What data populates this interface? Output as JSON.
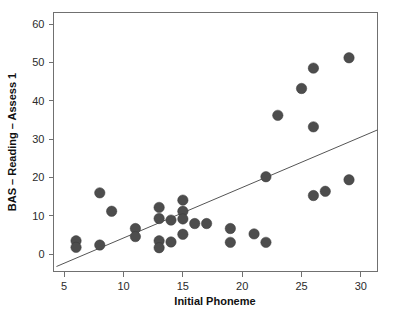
{
  "chart_data": {
    "type": "scatter",
    "title": "",
    "xlabel": "Initial Phoneme",
    "ylabel": "BAS – Reading – Assess 1",
    "xlim": [
      4.1,
      31.4
    ],
    "ylim": [
      -4.5,
      63.0
    ],
    "xticks": [
      5,
      10,
      15,
      20,
      25,
      30
    ],
    "yticks": [
      0,
      10,
      20,
      30,
      40,
      50,
      60
    ],
    "xtick_labels": [
      "5",
      "10",
      "15",
      "20",
      "25",
      "30"
    ],
    "ytick_labels": [
      "0",
      "10",
      "20",
      "30",
      "40",
      "50",
      "60"
    ],
    "grid": false,
    "legend": null,
    "marker": {
      "shape": "circle",
      "color": "#4d4d4d",
      "edge_color": "#3a3a3a",
      "size": 5.2
    },
    "series": [
      {
        "name": "Participants",
        "points": [
          {
            "x": 6,
            "y": 3.5
          },
          {
            "x": 6,
            "y": 1.8
          },
          {
            "x": 8,
            "y": 16.0
          },
          {
            "x": 8,
            "y": 2.4
          },
          {
            "x": 9,
            "y": 11.2
          },
          {
            "x": 11,
            "y": 6.7
          },
          {
            "x": 11,
            "y": 4.6
          },
          {
            "x": 13,
            "y": 12.2
          },
          {
            "x": 13,
            "y": 9.3
          },
          {
            "x": 13,
            "y": 3.5
          },
          {
            "x": 13,
            "y": 1.7
          },
          {
            "x": 14,
            "y": 8.9
          },
          {
            "x": 14,
            "y": 3.2
          },
          {
            "x": 15,
            "y": 14.1
          },
          {
            "x": 15,
            "y": 11.2
          },
          {
            "x": 15,
            "y": 9.2
          },
          {
            "x": 15,
            "y": 5.2
          },
          {
            "x": 16,
            "y": 8.0
          },
          {
            "x": 17,
            "y": 8.0
          },
          {
            "x": 19,
            "y": 6.7
          },
          {
            "x": 19,
            "y": 3.1
          },
          {
            "x": 21,
            "y": 5.3
          },
          {
            "x": 22,
            "y": 20.2
          },
          {
            "x": 22,
            "y": 3.1
          },
          {
            "x": 23,
            "y": 36.2
          },
          {
            "x": 25,
            "y": 43.2
          },
          {
            "x": 26,
            "y": 48.5
          },
          {
            "x": 26,
            "y": 33.2
          },
          {
            "x": 26,
            "y": 15.3
          },
          {
            "x": 27,
            "y": 16.4
          },
          {
            "x": 29,
            "y": 51.2
          },
          {
            "x": 29,
            "y": 19.4
          }
        ]
      }
    ],
    "fit_line": {
      "name": "regression-line",
      "color": "#555555",
      "x_start": 4.35,
      "y_start": -3.2,
      "x_end": 31.4,
      "y_end": 32.4
    }
  }
}
